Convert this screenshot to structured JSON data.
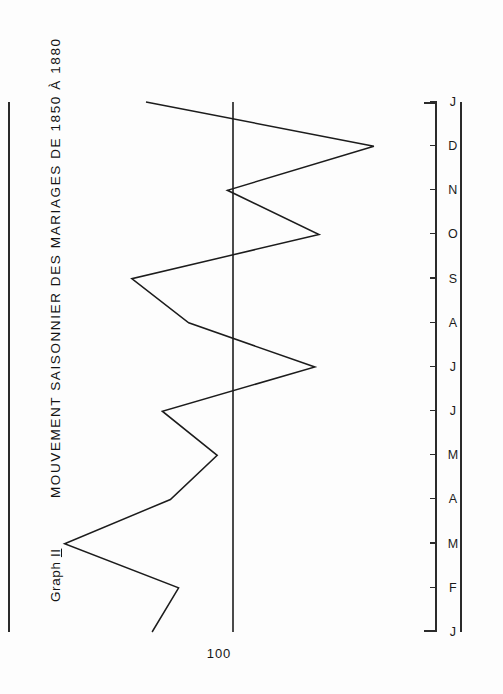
{
  "figure": {
    "label_prefix": "Graph",
    "label_number": "II",
    "title": "MOUVEMENT  SAISONNIER  DES  MARIAGES  DE  1850  À  1880",
    "baseline_label": "100",
    "ink_color": "#1c1c1c",
    "paper_color": "#fdfdfd",
    "orientation": "rotated-90-clockwise"
  },
  "chart_data": {
    "type": "line",
    "title": "MOUVEMENT  SAISONNIER  DES  MARIAGES  DE  1850  À  1880",
    "subtitle": "Graph II",
    "xlabel": "",
    "ylabel": "",
    "categories": [
      "J",
      "F",
      "M",
      "A",
      "M",
      "J",
      "J",
      "A",
      "S",
      "O",
      "N",
      "D",
      "J"
    ],
    "values": [
      140,
      127,
      183,
      131,
      108,
      135,
      60,
      122,
      150,
      58,
      103,
      31,
      143
    ],
    "series": [
      {
        "name": "Indice saisonnier des mariages",
        "values": [
          140,
          127,
          183,
          131,
          108,
          135,
          60,
          122,
          150,
          58,
          103,
          31,
          143
        ]
      }
    ],
    "reference_lines": [
      {
        "value": 100,
        "label": "100",
        "orientation": "horizontal"
      }
    ],
    "ylim": [
      0,
      200
    ],
    "grid": false,
    "legend": "none",
    "tick_labels_x": [
      "J",
      "F",
      "M",
      "A",
      "M",
      "J",
      "J",
      "A",
      "S",
      "O",
      "N",
      "D",
      "J"
    ],
    "tick_labels_y": [
      "100"
    ]
  }
}
